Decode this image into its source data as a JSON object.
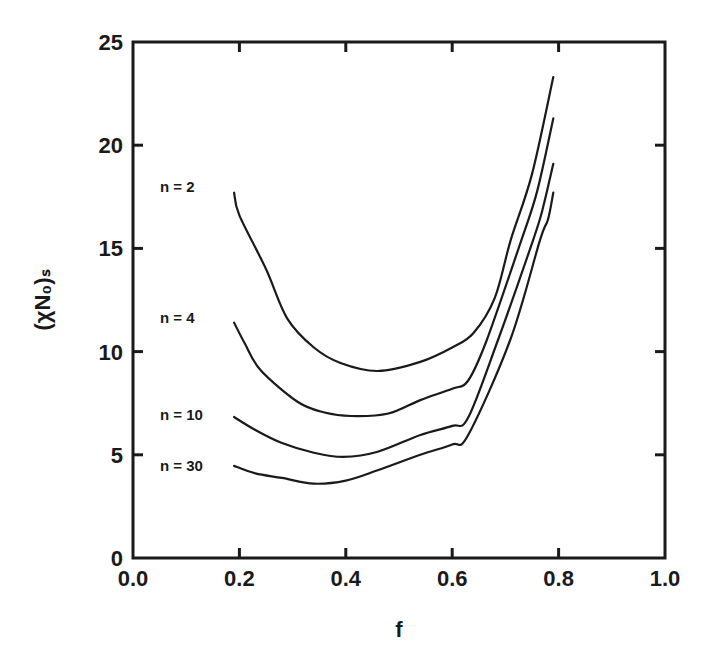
{
  "chart_data": {
    "type": "line",
    "title": "",
    "xlabel": "f",
    "ylabel": "(χN₀)ₛ",
    "xlim": [
      0.0,
      1.0
    ],
    "ylim": [
      0,
      25
    ],
    "x_ticks": [
      "0.0",
      "0.2",
      "0.4",
      "0.6",
      "0.8",
      "1.0"
    ],
    "y_ticks": [
      "0",
      "5",
      "10",
      "15",
      "20",
      "25"
    ],
    "grid": false,
    "legend": "inline labels at left of each curve",
    "series": [
      {
        "name": "n = 2",
        "label_value_y": 18.0,
        "points": [
          [
            0.19,
            17.7
          ],
          [
            0.2,
            16.6
          ],
          [
            0.25,
            14.0
          ],
          [
            0.29,
            11.6
          ],
          [
            0.34,
            10.2
          ],
          [
            0.39,
            9.45
          ],
          [
            0.46,
            9.06
          ],
          [
            0.54,
            9.5
          ],
          [
            0.6,
            10.2
          ],
          [
            0.64,
            10.9
          ],
          [
            0.68,
            12.6
          ],
          [
            0.71,
            15.4
          ],
          [
            0.75,
            18.6
          ],
          [
            0.79,
            23.3
          ]
        ]
      },
      {
        "name": "n = 4",
        "label_value_y": 11.7,
        "points": [
          [
            0.19,
            11.4
          ],
          [
            0.21,
            10.4
          ],
          [
            0.24,
            9.1
          ],
          [
            0.31,
            7.56
          ],
          [
            0.36,
            7.05
          ],
          [
            0.41,
            6.88
          ],
          [
            0.48,
            7.0
          ],
          [
            0.54,
            7.65
          ],
          [
            0.6,
            8.2
          ],
          [
            0.63,
            8.6
          ],
          [
            0.665,
            10.56
          ],
          [
            0.73,
            15.4
          ],
          [
            0.76,
            17.8
          ],
          [
            0.79,
            21.3
          ]
        ]
      },
      {
        "name": "n = 10",
        "label_value_y": 7.0,
        "points": [
          [
            0.19,
            6.83
          ],
          [
            0.23,
            6.2
          ],
          [
            0.28,
            5.57
          ],
          [
            0.34,
            5.1
          ],
          [
            0.395,
            4.9
          ],
          [
            0.46,
            5.15
          ],
          [
            0.54,
            5.96
          ],
          [
            0.6,
            6.4
          ],
          [
            0.63,
            6.8
          ],
          [
            0.686,
            10.56
          ],
          [
            0.752,
            15.4
          ],
          [
            0.77,
            16.9
          ],
          [
            0.79,
            19.1
          ]
        ]
      },
      {
        "name": "n = 30",
        "label_value_y": 4.5,
        "points": [
          [
            0.19,
            4.46
          ],
          [
            0.23,
            4.1
          ],
          [
            0.28,
            3.88
          ],
          [
            0.34,
            3.6
          ],
          [
            0.4,
            3.75
          ],
          [
            0.46,
            4.25
          ],
          [
            0.54,
            5.0
          ],
          [
            0.6,
            5.5
          ],
          [
            0.63,
            5.96
          ],
          [
            0.709,
            10.56
          ],
          [
            0.765,
            15.4
          ],
          [
            0.78,
            16.4
          ],
          [
            0.79,
            17.7
          ]
        ]
      }
    ]
  }
}
